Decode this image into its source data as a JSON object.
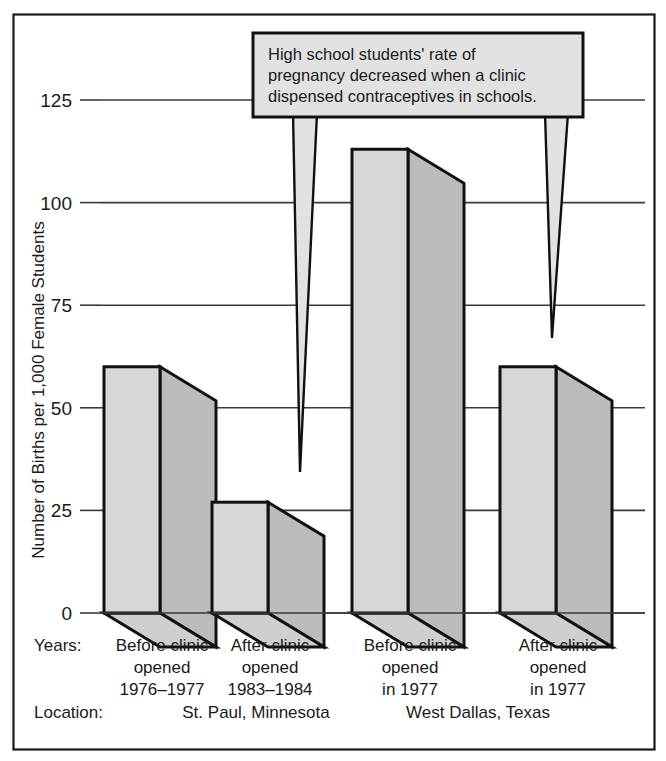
{
  "figure": {
    "frame_color": "#1a1a1a",
    "background": "#ffffff"
  },
  "callout": {
    "name": "annotation-callout",
    "line1": "High school students' rate of",
    "line2": "pregnancy decreased when a clinic",
    "line3": "dispensed contraceptives in schools.",
    "fill": "#e2e2e2",
    "stroke": "#111111"
  },
  "axis": {
    "y_title": "Number of Births per 1,000 Female Students",
    "tick_labels": [
      "0",
      "25",
      "50",
      "75",
      "100",
      "125"
    ]
  },
  "rows": {
    "years_label": "Years:",
    "location_label": "Location:"
  },
  "locations": [
    {
      "name": "st-paul",
      "label": "St. Paul, Minnesota"
    },
    {
      "name": "west-dallas",
      "label": "West Dallas, Texas"
    }
  ],
  "categories": [
    {
      "line1": "Before clinic",
      "line2": "opened",
      "line3": "1976–1977"
    },
    {
      "line1": "After clinic",
      "line2": "opened",
      "line3": "1983–1984"
    },
    {
      "line1": "Before clinic",
      "line2": "opened",
      "line3": "in 1977"
    },
    {
      "line1": "After clinic",
      "line2": "opened",
      "line3": "in 1977"
    }
  ],
  "colors": {
    "bar_front": "#d7d7d7",
    "bar_side": "#bcbcbc",
    "bar_top": "#cfcfcf",
    "bar_outline": "#111111",
    "gridline": "#3a3a3a"
  },
  "chart_data": {
    "type": "bar",
    "title": "",
    "subtitle": "",
    "xlabel": "",
    "ylabel": "Number of Births per 1,000 Female Students",
    "categories": [
      "Before clinic opened 1976–1977",
      "After clinic opened 1983–1984",
      "Before clinic opened in 1977",
      "After clinic opened in 1977"
    ],
    "groups": [
      "St. Paul, Minnesota",
      "St. Paul, Minnesota",
      "West Dallas, Texas",
      "West Dallas, Texas"
    ],
    "values": [
      60,
      27,
      113,
      60
    ],
    "ylim": [
      0,
      137
    ],
    "yticks": [
      0,
      25,
      50,
      75,
      100,
      125
    ],
    "grid": true,
    "legend": "none",
    "annotation": "High school students' rate of pregnancy decreased when a clinic dispensed contraceptives in schools."
  }
}
